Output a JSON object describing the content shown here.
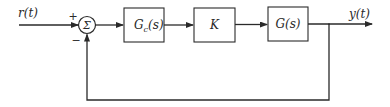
{
  "diagram": {
    "type": "feedback-control-block-diagram",
    "input": {
      "label": "r(t)"
    },
    "summing_junction": {
      "symbol": "Σ",
      "signs": {
        "top": "+",
        "bottom": "−"
      }
    },
    "blocks": [
      {
        "id": "controller",
        "label_main": "G",
        "label_sub": "c",
        "label_tail": "(s)"
      },
      {
        "id": "gain",
        "label": "K"
      },
      {
        "id": "plant",
        "label": "G(s)"
      }
    ],
    "output": {
      "label": "y(t)"
    },
    "feedback": {
      "type": "unity",
      "sign": "negative"
    },
    "colors": {
      "stroke": "#2a2a2a",
      "background": "#ffffff"
    }
  }
}
